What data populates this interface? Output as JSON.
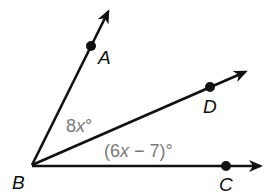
{
  "diagram": {
    "vertex": {
      "name": "B",
      "x": 32,
      "y": 165
    },
    "rays": [
      {
        "name": "BA",
        "point": "A",
        "point_xy": [
          91,
          45
        ],
        "end_xy": [
          108,
          10
        ],
        "label_xy": [
          98,
          62
        ]
      },
      {
        "name": "BD",
        "point": "D",
        "point_xy": [
          210,
          87
        ],
        "end_xy": [
          247,
          71
        ],
        "label_xy": [
          200,
          112
        ]
      },
      {
        "name": "BC",
        "point": "C",
        "point_xy": [
          226,
          166
        ],
        "end_xy": [
          262,
          166
        ],
        "label_xy": [
          218,
          190
        ]
      }
    ],
    "angles": [
      {
        "name": "ABD",
        "coef": "8",
        "var": "x",
        "deg": "°",
        "text": "8x°"
      },
      {
        "name": "DBC",
        "open": "(6",
        "var": "x",
        "rest": " − 7)°",
        "text": "(6x − 7)°"
      }
    ],
    "labels": {
      "A": "A",
      "B": "B",
      "C": "C",
      "D": "D"
    },
    "colors": {
      "line": "#111111",
      "angle_label": "#7a7a7a"
    }
  }
}
